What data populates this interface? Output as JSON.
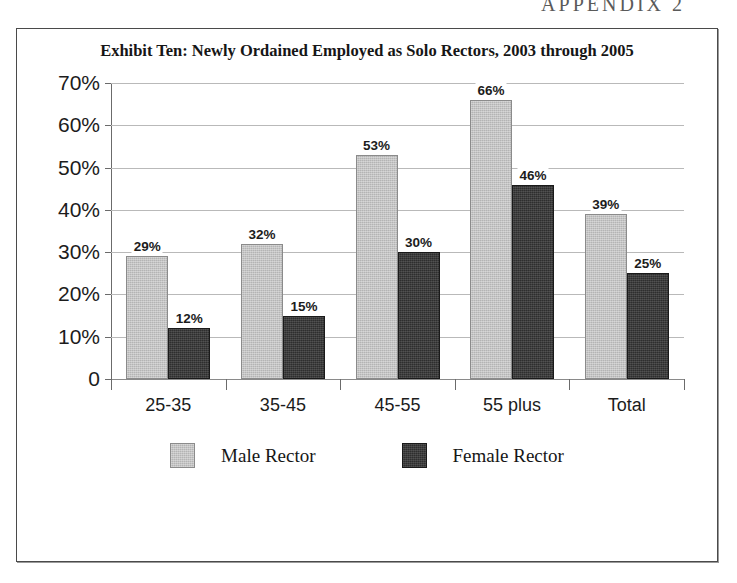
{
  "page": {
    "running_head": "APPENDIX 2"
  },
  "chart_data": {
    "type": "bar",
    "title": "Exhibit Ten: Newly Ordained Employed as Solo Rectors, 2003 through 2005",
    "xlabel": "",
    "ylabel": "",
    "categories": [
      "25-35",
      "35-45",
      "45-55",
      "55 plus",
      "Total"
    ],
    "series": [
      {
        "name": "Male Rector",
        "color": "#b4b4b4",
        "values": [
          29,
          32,
          53,
          66,
          39
        ],
        "labels": [
          "29%",
          "32%",
          "53%",
          "66%",
          "39%"
        ]
      },
      {
        "name": "Female Rector",
        "color": "#2e2e2e",
        "values": [
          12,
          15,
          30,
          46,
          25
        ],
        "labels": [
          "12%",
          "15%",
          "30%",
          "46%",
          "25%"
        ]
      }
    ],
    "ylim": [
      0,
      70
    ],
    "ytick_values": [
      70,
      60,
      50,
      40,
      30,
      20,
      10,
      0
    ],
    "ytick_labels": [
      "70%",
      "60%",
      "50%",
      "40%",
      "30%",
      "20%",
      "10%",
      "0"
    ],
    "grid": true,
    "legend_position": "bottom",
    "legend": [
      "Male Rector",
      "Female Rector"
    ]
  }
}
